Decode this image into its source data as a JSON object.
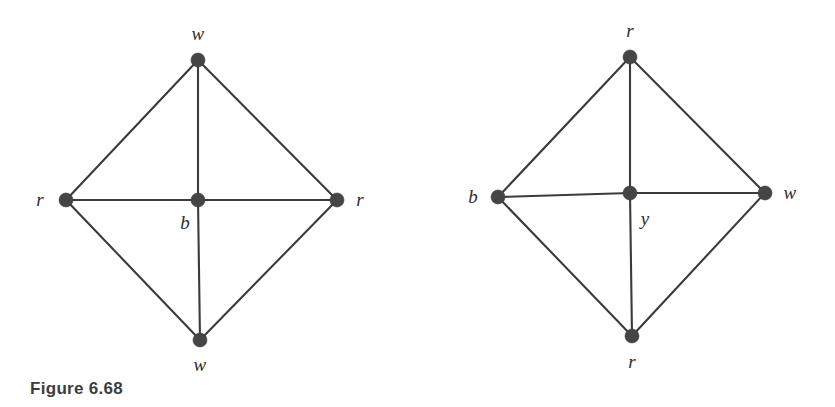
{
  "figure": {
    "caption": "Figure 6.68",
    "background_color": "#ffffff",
    "edge_color": "#3b3b3b",
    "vertex_color": "#454545",
    "label_color": "#2e2e2e"
  },
  "graphs": [
    {
      "id": "left-graph",
      "name": "left-graph",
      "vertices": [
        {
          "id": "L-top",
          "label": "w",
          "cx": 198,
          "cy": 60,
          "r": 7.0,
          "label_x": 198,
          "label_y": 33,
          "label_pos": "above"
        },
        {
          "id": "L-left",
          "label": "r",
          "cx": 66,
          "cy": 200,
          "r": 7.0,
          "label_x": 40,
          "label_y": 199,
          "label_pos": "left"
        },
        {
          "id": "L-center",
          "label": "b",
          "cx": 198,
          "cy": 200,
          "r": 7.0,
          "label_x": 185,
          "label_y": 222,
          "label_pos": "below-left"
        },
        {
          "id": "L-right",
          "label": "r",
          "cx": 337,
          "cy": 200,
          "r": 7.0,
          "label_x": 360,
          "label_y": 199,
          "label_pos": "right"
        },
        {
          "id": "L-bottom",
          "label": "w",
          "cx": 200,
          "cy": 340,
          "r": 7.0,
          "label_x": 200,
          "label_y": 364,
          "label_pos": "below"
        }
      ],
      "edges": [
        {
          "from": "L-top",
          "to": "L-left"
        },
        {
          "from": "L-top",
          "to": "L-right"
        },
        {
          "from": "L-top",
          "to": "L-center"
        },
        {
          "from": "L-left",
          "to": "L-center"
        },
        {
          "from": "L-center",
          "to": "L-right"
        },
        {
          "from": "L-left",
          "to": "L-bottom"
        },
        {
          "from": "L-right",
          "to": "L-bottom"
        },
        {
          "from": "L-center",
          "to": "L-bottom"
        }
      ]
    },
    {
      "id": "right-graph",
      "name": "right-graph",
      "vertices": [
        {
          "id": "R-top",
          "label": "r",
          "cx": 630,
          "cy": 57,
          "r": 7.0,
          "label_x": 630,
          "label_y": 30,
          "label_pos": "above"
        },
        {
          "id": "R-left",
          "label": "b",
          "cx": 498,
          "cy": 197,
          "r": 7.0,
          "label_x": 473,
          "label_y": 196,
          "label_pos": "left"
        },
        {
          "id": "R-center",
          "label": "y",
          "cx": 630,
          "cy": 193,
          "r": 7.0,
          "label_x": 645,
          "label_y": 218,
          "label_pos": "below-right"
        },
        {
          "id": "R-right",
          "label": "w",
          "cx": 765,
          "cy": 193,
          "r": 7.0,
          "label_x": 790,
          "label_y": 192,
          "label_pos": "right"
        },
        {
          "id": "R-bottom",
          "label": "r",
          "cx": 632,
          "cy": 336,
          "r": 7.0,
          "label_x": 632,
          "label_y": 361,
          "label_pos": "below"
        }
      ],
      "edges": [
        {
          "from": "R-top",
          "to": "R-left"
        },
        {
          "from": "R-top",
          "to": "R-right"
        },
        {
          "from": "R-top",
          "to": "R-center"
        },
        {
          "from": "R-left",
          "to": "R-center"
        },
        {
          "from": "R-center",
          "to": "R-right"
        },
        {
          "from": "R-left",
          "to": "R-bottom"
        },
        {
          "from": "R-right",
          "to": "R-bottom"
        },
        {
          "from": "R-center",
          "to": "R-bottom"
        }
      ]
    }
  ]
}
